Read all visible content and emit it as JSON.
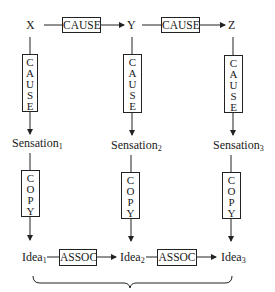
{
  "diagram": {
    "top_row": {
      "nodes": [
        {
          "label": "X",
          "sub": ""
        },
        {
          "label": "Y",
          "sub": ""
        },
        {
          "label": "Z",
          "sub": ""
        }
      ],
      "links": [
        {
          "label": "CAUSE",
          "from": "X",
          "to": "Y"
        },
        {
          "label": "CAUSE",
          "from": "Y",
          "to": "Z"
        }
      ]
    },
    "vertical_cause": {
      "label": "CAUSE",
      "letters": [
        "C",
        "A",
        "U",
        "S",
        "E"
      ]
    },
    "middle_row": {
      "nodes": [
        {
          "label": "Sensation",
          "sub": "1"
        },
        {
          "label": "Sensation",
          "sub": "2"
        },
        {
          "label": "Sensation",
          "sub": "3"
        }
      ]
    },
    "vertical_copy": {
      "label": "COPY",
      "letters": [
        "C",
        "O",
        "P",
        "Y"
      ]
    },
    "bottom_row": {
      "nodes": [
        {
          "label": "Idea",
          "sub": "1"
        },
        {
          "label": "Idea",
          "sub": "2"
        },
        {
          "label": "Idea",
          "sub": "3"
        }
      ],
      "links": [
        {
          "label": "ASSOC",
          "from": "Idea1",
          "to": "Idea2"
        },
        {
          "label": "ASSOC",
          "from": "Idea2",
          "to": "Idea3"
        }
      ]
    },
    "brace": {
      "spans": "Idea1-Idea3",
      "orientation": "below"
    }
  }
}
